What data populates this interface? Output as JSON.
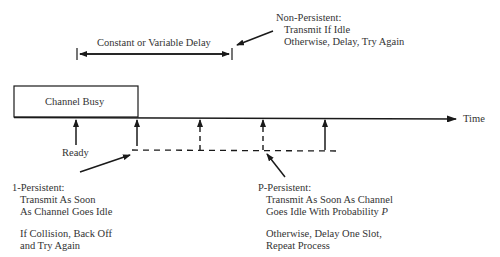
{
  "delay_label": "Constant or Variable Delay",
  "channel_busy_label": "Channel Busy",
  "time_label": "Time",
  "ready_label": "Ready",
  "non_persistent": {
    "heading": "Non-Persistent:",
    "lines": [
      "Transmit If Idle",
      "Otherwise, Delay, Try Again"
    ]
  },
  "one_persistent": {
    "heading": "1-Persistent:",
    "lines": [
      "Transmit As Soon",
      "As Channel Goes Idle"
    ],
    "lines2": [
      "If Collision, Back Off",
      "and Try Again"
    ]
  },
  "p_persistent": {
    "heading": "P-Persistent:",
    "line1": "Transmit As Soon As Channel",
    "line2_text": "Goes Idle With Probability ",
    "line2_var": "P",
    "lines2": [
      "Otherwise, Delay One Slot,",
      "Repeat Process"
    ]
  },
  "colors": {
    "line": "#1a1a1a",
    "text": "#333333",
    "background": "#ffffff"
  }
}
